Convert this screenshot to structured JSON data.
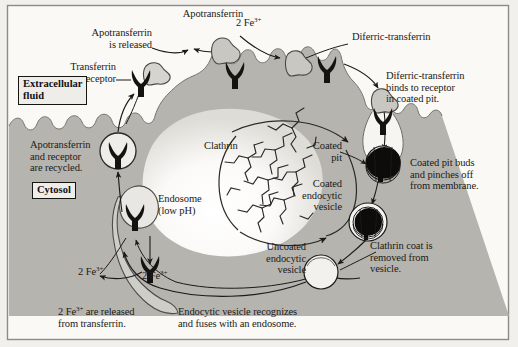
{
  "figure": {
    "frame_color": "#8d8b85",
    "background_color": "#f0eeea",
    "cytosol_color": "#b5b3ad",
    "extracellular_color": "#f7f6f3",
    "ink_color": "#1b1a18"
  },
  "region_labels": {
    "extracellular": "Extracellular\nfluid",
    "cytosol": "Cytosol"
  },
  "labels": {
    "apotransferrin": "Apotransferrin",
    "apotransferrin_released": "Apotransferrin\nis released",
    "transferrin_receptor": "Transferrin\nreceptor",
    "two_fe_top": "2 Fe",
    "two_fe_top_charge": "3+",
    "diferric_transferrin": "Diferric-transferrin",
    "diferric_binds": "Diferric-transferrin\nbinds to receptor\nin coated pit.",
    "coated_pit": "Coated\npit",
    "coated_pit_buds": "Coated pit buds\nand pinches off\nfrom membrane.",
    "clathrin": "Clathrin",
    "coated_endocytic_vesicle": "Coated\nendocytic\nvesicle",
    "clathrin_removed": "Clathrin coat is\nremoved from\nvesicle.",
    "uncoated_endocytic_vesicle": "Uncoated\nendocytic\nvesicle",
    "vesicle_fuses": "Endocytic vesicle recognizes\nand fuses with an endosome.",
    "endosome": "Endosome\n(low pH)",
    "recycled": "Apotransferrin\nand receptor\nare recycled.",
    "fe_released_left": "2 Fe",
    "fe_released_left_charge": "3+",
    "fe_released_mid": "2 Fe",
    "fe_released_mid_charge": "3+",
    "fe_released_caption_a": "2 Fe",
    "fe_released_caption_charge": "3+",
    "fe_released_caption_b": " are released\nfrom transferrin."
  },
  "bleed_through": {
    "line1": "or  nes  an  ordio  n  ro  es  of  ransferrin",
    "line2": "rec  or  in  lated  cells  in  ulture",
    "line3": "is bou  to the cel  urface  and  ter",
    "line4": "ron  o  os  ne  in  e  cell",
    "line5": "e  ransferrin  recep  or  in  DNA",
    "line6": "sequence  n  he  reg  on"
  }
}
